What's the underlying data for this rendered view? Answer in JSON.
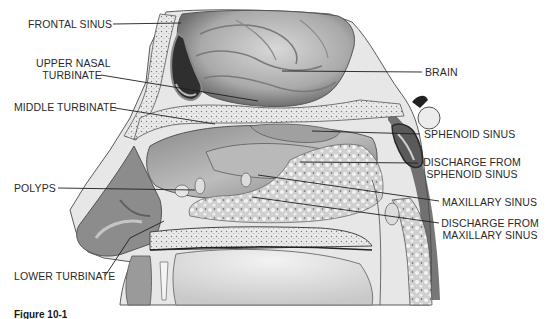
{
  "diagram": {
    "labels": {
      "frontal_sinus": "FRONTAL SINUS",
      "upper_nasal_turbinate_1": "UPPER NASAL",
      "upper_nasal_turbinate_2": "TURBINATE",
      "middle_turbinate": "MIDDLE TURBINATE",
      "polyps": "POLYPS",
      "lower_turbinate": "LOWER TURBINATE",
      "brain": "BRAIN",
      "sphenoid_sinus": "SPHENOID SINUS",
      "discharge_sphenoid_1": "DISCHARGE FROM",
      "discharge_sphenoid_2": "SPHENOID SINUS",
      "maxillary_sinus": "MAXILLARY SINUS",
      "discharge_maxillary_1": "DISCHARGE FROM",
      "discharge_maxillary_2": "MAXILLARY SINUS"
    },
    "caption": "Figure 10-1",
    "colors": {
      "line": "#1e1e1e",
      "text": "#2a2a2a",
      "tissue_light": "#e6e6e6",
      "tissue_mid": "#b5b5b5",
      "tissue_dark": "#6e6e6e",
      "cavity_dark": "#3a3a3a"
    }
  }
}
